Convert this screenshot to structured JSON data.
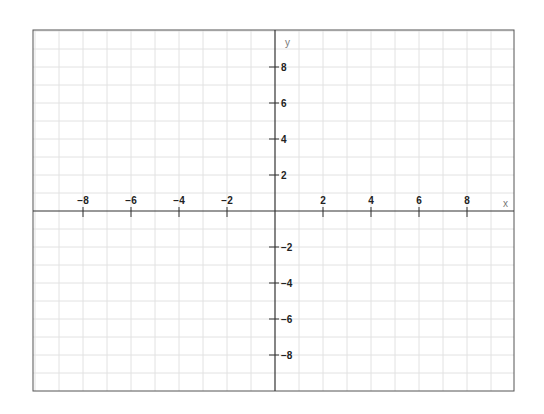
{
  "chart_data": {
    "type": "line",
    "title": "",
    "xlabel": "x",
    "ylabel": "y",
    "xlim": [
      -10,
      10
    ],
    "ylim": [
      -10,
      10
    ],
    "grid": true,
    "x_ticks": [
      -8,
      -6,
      -4,
      -2,
      2,
      4,
      6,
      8
    ],
    "y_ticks": [
      8,
      6,
      4,
      2,
      -2,
      -4,
      -6,
      -8
    ],
    "series": []
  },
  "colors": {
    "axis": "#333333",
    "grid": "#dddddd",
    "border": "#555555",
    "text": "#222222"
  }
}
